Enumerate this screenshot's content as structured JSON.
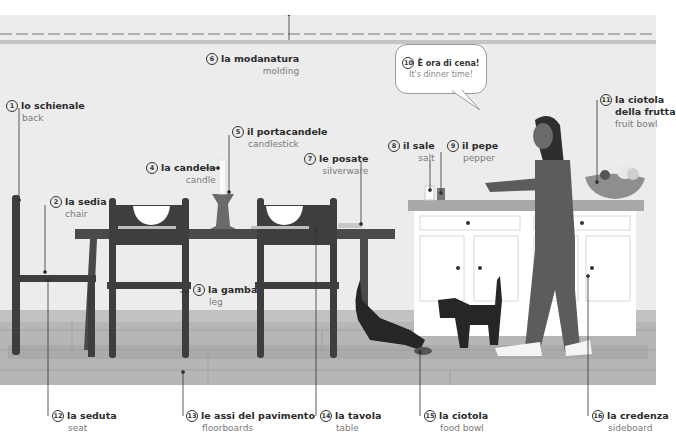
{
  "illustration": {
    "title": "Dining room and kitchen scene (Italian-English vocabulary)",
    "colors": {
      "wall": "#ececec",
      "molding_dark": "#a8a8a8",
      "molding_light": "#c8c8c8",
      "floor": "#b4b4b4",
      "floor_dark": "#9a9a9a",
      "furniture": "#4a4a4a",
      "sideboard": "#ffffff",
      "countertop": "#a6a6a6",
      "person": "#5c5c5c",
      "cat": "#262626"
    }
  },
  "labels": [
    {
      "num": "1",
      "it": "lo schienale",
      "en": "back"
    },
    {
      "num": "2",
      "it": "la sedia",
      "en": "chair"
    },
    {
      "num": "3",
      "it": "la gamba",
      "en": "leg"
    },
    {
      "num": "4",
      "it": "la candela",
      "en": "candle"
    },
    {
      "num": "5",
      "it": "il portacandele",
      "en": "candlestick"
    },
    {
      "num": "6",
      "it": "la modanatura",
      "en": "molding"
    },
    {
      "num": "7",
      "it": "le posate",
      "en": "silverware"
    },
    {
      "num": "8",
      "it": "il sale",
      "en": "salt"
    },
    {
      "num": "9",
      "it": "il pepe",
      "en": "pepper"
    },
    {
      "num": "10",
      "it": "È ora di cena!",
      "en": "It's dinner time!"
    },
    {
      "num": "11",
      "it": "la ciotola",
      "it2": "della frutta",
      "en": "fruit bowl"
    },
    {
      "num": "12",
      "it": "la seduta",
      "en": "seat"
    },
    {
      "num": "13",
      "it": "le assi del pavimento",
      "en": "floorboards"
    },
    {
      "num": "14",
      "it": "la tavola",
      "en": "table"
    },
    {
      "num": "15",
      "it": "la ciotola",
      "en": "food bowl"
    },
    {
      "num": "16",
      "it": "la credenza",
      "en": "sideboard"
    }
  ]
}
